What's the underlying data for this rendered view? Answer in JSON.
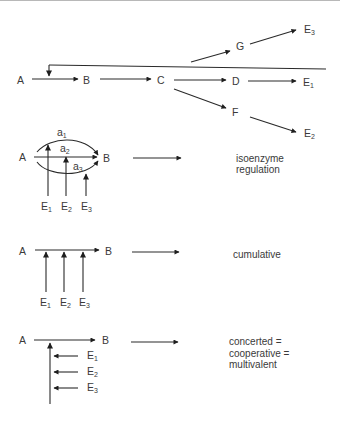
{
  "top_pathway": {
    "nodes": {
      "A": "A",
      "B": "B",
      "C": "C",
      "D": "D",
      "F": "F",
      "G": "G",
      "E1": {
        "base": "E",
        "sub": "1"
      },
      "E2": {
        "base": "E",
        "sub": "2"
      },
      "E3": {
        "base": "E",
        "sub": "3"
      }
    },
    "edges": [
      [
        "A",
        "B"
      ],
      [
        "B",
        "C"
      ],
      [
        "C",
        "D"
      ],
      [
        "D",
        "E1"
      ],
      [
        "C",
        "F"
      ],
      [
        "F",
        "E2"
      ],
      [
        "C",
        "G"
      ],
      [
        "G",
        "E3"
      ]
    ],
    "feedback": {
      "from": "end-products",
      "to": "A→B step",
      "type": "inhibition"
    }
  },
  "panels": [
    {
      "id": "isoenzyme",
      "substrate": "A",
      "product": "B",
      "isoenzymes": [
        {
          "base": "a",
          "sub": "1"
        },
        {
          "base": "a",
          "sub": "2"
        },
        {
          "base": "a",
          "sub": "3"
        }
      ],
      "effectors": [
        {
          "base": "E",
          "sub": "1"
        },
        {
          "base": "E",
          "sub": "2"
        },
        {
          "base": "E",
          "sub": "3"
        }
      ],
      "description_lines": [
        "isoenzyme",
        "regulation"
      ]
    },
    {
      "id": "cumulative",
      "substrate": "A",
      "product": "B",
      "effectors": [
        {
          "base": "E",
          "sub": "1"
        },
        {
          "base": "E",
          "sub": "2"
        },
        {
          "base": "E",
          "sub": "3"
        }
      ],
      "description_lines": [
        "cumulative"
      ]
    },
    {
      "id": "concerted",
      "substrate": "A",
      "product": "B",
      "effectors": [
        {
          "base": "E",
          "sub": "1"
        },
        {
          "base": "E",
          "sub": "2"
        },
        {
          "base": "E",
          "sub": "3"
        }
      ],
      "description_lines": [
        "concerted =",
        "cooperative =",
        "multivalent"
      ]
    }
  ],
  "colors": {
    "ink": "#2a2a2a",
    "text": "#3a3a3a",
    "background": "#ffffff"
  }
}
